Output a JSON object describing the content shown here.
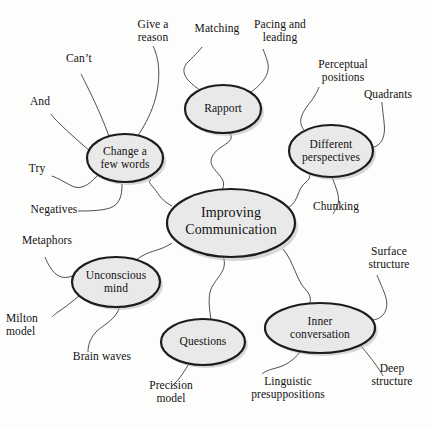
{
  "diagram": {
    "type": "mind-map",
    "title": "Improving Communication",
    "background_color": "#fdfdfc",
    "node_fill_color": "#e9e9e9",
    "node_border_color": "#1c1c1c",
    "connector_color": "#3a3a3a",
    "center": {
      "label": "Improving\nCommunication",
      "line1": "Improving",
      "line2": "Communication"
    },
    "branches": [
      {
        "id": "change-a-few-words",
        "label": "Change a\nfew words",
        "line1": "Change a",
        "line2": "few words",
        "leaves": [
          {
            "id": "give-a-reason",
            "label": "Give a\nreason"
          },
          {
            "id": "cant",
            "label": "Can’t"
          },
          {
            "id": "and",
            "label": "And"
          },
          {
            "id": "try",
            "label": "Try"
          },
          {
            "id": "negatives",
            "label": "Negatives"
          }
        ]
      },
      {
        "id": "rapport",
        "label": "Rapport",
        "line1": "Rapport",
        "line2": "",
        "leaves": [
          {
            "id": "matching",
            "label": "Matching"
          },
          {
            "id": "pacing-and-leading",
            "label": "Pacing and\nleading"
          }
        ]
      },
      {
        "id": "different-perspectives",
        "label": "Different\nperspectives",
        "line1": "Different",
        "line2": "perspectives",
        "leaves": [
          {
            "id": "perceptual-positions",
            "label": "Perceptual\npositions"
          },
          {
            "id": "quadrants",
            "label": "Quadrants"
          },
          {
            "id": "chunking",
            "label": "Chunking"
          }
        ]
      },
      {
        "id": "inner-conversation",
        "label": "Inner\nconversation",
        "line1": "Inner",
        "line2": "conversation",
        "leaves": [
          {
            "id": "surface-structure",
            "label": "Surface\nstructure"
          },
          {
            "id": "deep-structure",
            "label": "Deep\nstructure"
          },
          {
            "id": "linguistic-presuppositions",
            "label": "Linguistic\npresuppositions"
          }
        ]
      },
      {
        "id": "questions",
        "label": "Questions",
        "line1": "Questions",
        "line2": "",
        "leaves": [
          {
            "id": "precision-model",
            "label": "Precision\nmodel"
          }
        ]
      },
      {
        "id": "unconscious-mind",
        "label": "Unconscious\nmind",
        "line1": "Unconscious",
        "line2": "mind",
        "leaves": [
          {
            "id": "metaphors",
            "label": "Metaphors"
          },
          {
            "id": "milton-model",
            "label": "Milton\nmodel"
          },
          {
            "id": "brain-waves",
            "label": "Brain waves"
          }
        ]
      }
    ]
  }
}
